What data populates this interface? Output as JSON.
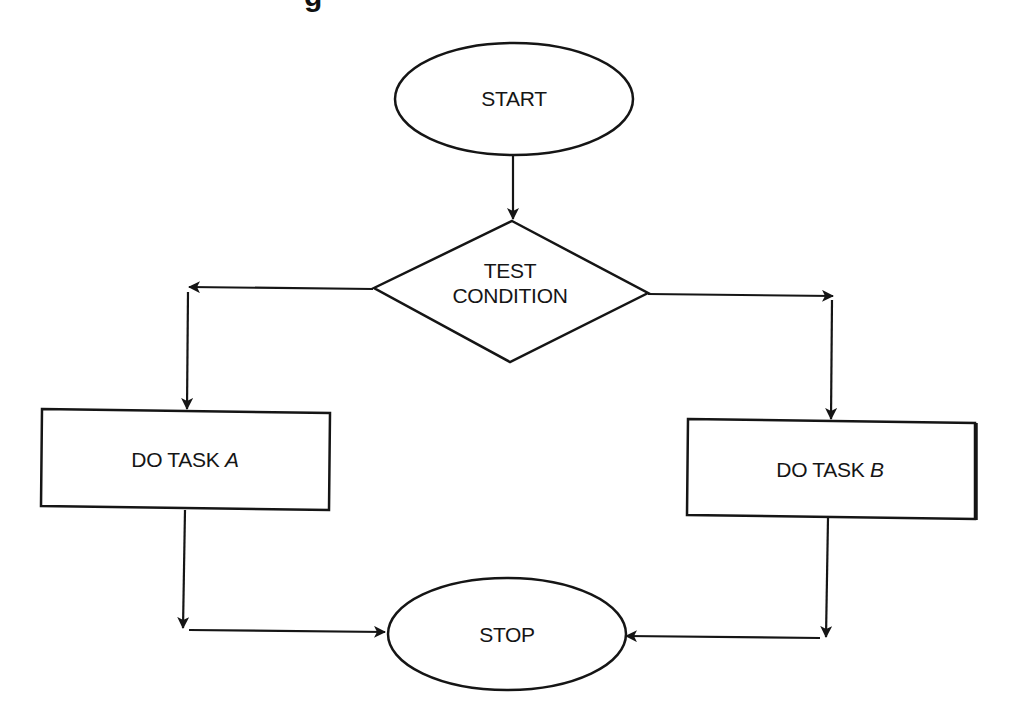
{
  "title": {
    "text": "g",
    "note": "partially visible descender of a cut-off heading at top"
  },
  "diagram": {
    "type": "flowchart",
    "nodes": [
      {
        "id": "start",
        "shape": "ellipse",
        "label": "START"
      },
      {
        "id": "test",
        "shape": "diamond",
        "label_line1": "TEST",
        "label_line2": "CONDITION"
      },
      {
        "id": "taskA",
        "shape": "rectangle",
        "label_prefix": "DO TASK ",
        "label_var": "A"
      },
      {
        "id": "taskB",
        "shape": "rectangle",
        "label_prefix": "DO TASK ",
        "label_var": "B"
      },
      {
        "id": "stop",
        "shape": "ellipse",
        "label": "STOP"
      }
    ],
    "edges": [
      {
        "from": "start",
        "to": "test"
      },
      {
        "from": "test",
        "to": "taskA",
        "direction": "left branch"
      },
      {
        "from": "test",
        "to": "taskB",
        "direction": "right branch"
      },
      {
        "from": "taskA",
        "to": "stop"
      },
      {
        "from": "taskB",
        "to": "stop"
      }
    ]
  },
  "colors": {
    "stroke": "#151515",
    "background": "#ffffff"
  }
}
